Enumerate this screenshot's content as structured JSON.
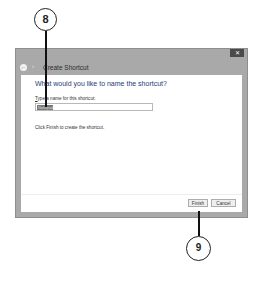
{
  "callouts": [
    {
      "number": "8"
    },
    {
      "number": "9"
    }
  ],
  "window": {
    "title": "Create Shortcut",
    "close_icon": "close-icon",
    "back_icon": "back-arrow-icon",
    "heading": "What would you like to name the shortcut?",
    "name_label": "Type a name for this shortcut:",
    "name_label_accel": "T",
    "name_label_rest": "ype a name for this shortcut:",
    "name_value": "Notepad",
    "hint": "Click Finish to create the shortcut.",
    "buttons": {
      "finish": "Finish",
      "cancel": "Cancel"
    }
  }
}
